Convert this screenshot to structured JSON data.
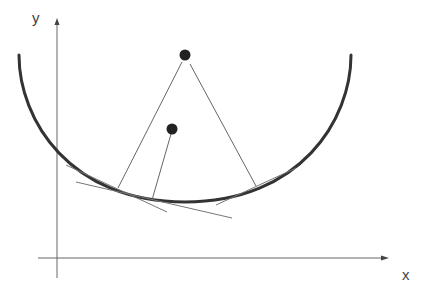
{
  "diagram": {
    "axes": {
      "y_label": "y",
      "x_label": "x",
      "color": "#555555"
    },
    "curve": {
      "description": "U-shaped circular arc (concave up)",
      "color": "#333333",
      "left_end": [
        19,
        55
      ],
      "right_end": [
        351,
        55
      ],
      "bottom": [
        185,
        202
      ]
    },
    "points": [
      {
        "name": "upper-point",
        "cx": 185,
        "cy": 55,
        "r": 5
      },
      {
        "name": "lower-point",
        "cx": 172,
        "cy": 129,
        "r": 5
      }
    ],
    "normal_lines": [
      {
        "from": [
          185,
          55
        ],
        "to": [
          118,
          188
        ]
      },
      {
        "from": [
          185,
          55
        ],
        "to": [
          256,
          186
        ]
      },
      {
        "from": [
          172,
          129
        ],
        "to": [
          152,
          200
        ]
      }
    ],
    "tangent_lines": [
      {
        "from": [
          66,
          165
        ],
        "to": [
          167,
          212
        ]
      },
      {
        "from": [
          76,
          182
        ],
        "to": [
          232,
          218
        ]
      },
      {
        "from": [
          216,
          205
        ],
        "to": [
          296,
          168
        ]
      }
    ],
    "colors": {
      "line": "#666666",
      "dot": "#222222",
      "curve": "#333333"
    }
  }
}
